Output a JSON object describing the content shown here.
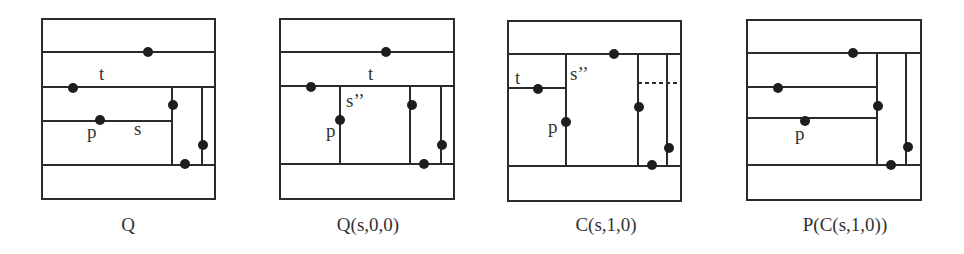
{
  "figure": {
    "panels": [
      {
        "id": "Q",
        "caption": "Q",
        "caption_x": 128,
        "labels": {
          "t": "t",
          "p": "p",
          "s": "s"
        }
      },
      {
        "id": "Q_s00",
        "caption": "Q(s,0,0)",
        "caption_x": 368,
        "labels": {
          "t": "t",
          "p": "p",
          "s2": "s’’"
        }
      },
      {
        "id": "C_s10",
        "caption": "C(s,1,0)",
        "caption_x": 606,
        "labels": {
          "t": "t",
          "p": "p",
          "s2": "s’’"
        }
      },
      {
        "id": "P_C_s10",
        "caption": "P(C(s,1,0))",
        "caption_x": 845,
        "labels": {
          "p": "p"
        }
      }
    ],
    "colors": {
      "line": "#2b2b2b",
      "point": "#1e1e1e",
      "text": "#333333"
    }
  }
}
